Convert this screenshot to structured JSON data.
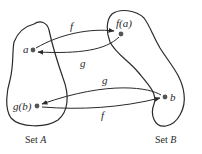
{
  "diagram": {
    "sets": [
      {
        "id": "A",
        "label": "Set A",
        "label_prefix": "Set ",
        "label_var": "A"
      },
      {
        "id": "B",
        "label": "Set B",
        "label_prefix": "Set ",
        "label_var": "B"
      }
    ],
    "points": [
      {
        "id": "a",
        "label": "a",
        "set": "A"
      },
      {
        "id": "g_b",
        "label": "g(b)",
        "set": "A"
      },
      {
        "id": "f_a",
        "label": "f(a)",
        "set": "B"
      },
      {
        "id": "b",
        "label": "b",
        "set": "B"
      }
    ],
    "arrows": [
      {
        "label": "f",
        "from": "a",
        "to": "f(a)"
      },
      {
        "label": "g",
        "from": "f(a)",
        "to": "a"
      },
      {
        "label": "g",
        "from": "b",
        "to": "g(b)"
      },
      {
        "label": "f",
        "from": "g(b)",
        "to": "b"
      }
    ],
    "colors": {
      "stroke": "#2a2a2a",
      "point": "#555555",
      "background": "#ffffff"
    }
  }
}
